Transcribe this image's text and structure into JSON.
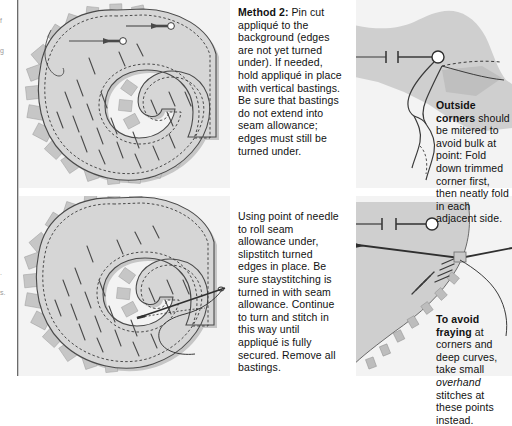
{
  "page": {
    "background_color": "#ffffff",
    "panel_color": "#f3f3f3",
    "fabric_color": "#d4d4d4",
    "fabric_shadow_color": "#bdbdbd",
    "ink_color": "#3a3a3a",
    "text_color": "#111111"
  },
  "margin_fragments": [
    {
      "name": "left-edge-fragment-1",
      "text": "f"
    },
    {
      "name": "left-edge-fragment-2",
      "text": "g"
    },
    {
      "name": "left-edge-fragment-3",
      "text": "."
    },
    {
      "name": "left-edge-fragment-4",
      "text": "s."
    }
  ],
  "text_blocks": {
    "method2": {
      "heading": "Method 2:",
      "body": " Pin cut appliqué to the background (edges are not yet turned under). If needed, hold appliqué in place with vertical bastings. Be sure that bastings do not extend into seam allowance; edges must still be turned under."
    },
    "slipstitch": {
      "heading": "",
      "body": "Using point of needle to roll seam allowance under, slipstitch turned edges in place. Be sure staystitching is turned in with seam allowance. Continue to turn and stitch in this way until appliqué is fully secured. Remove all bastings."
    },
    "outside_corners": {
      "heading": "Outside corners",
      "body": " should be mitered to avoid bulk at point: Fold down trimmed corner first, then neatly fold in each adjacent side."
    },
    "avoid_fraying": {
      "heading": "To avoid fraying",
      "body_pre": " at corners and deep curves, take small ",
      "body_em": "overhand",
      "body_post": " stitches at these points instead."
    }
  },
  "figures": {
    "top_left": {
      "name": "figure-pinned-applique",
      "caption_ref": "method2",
      "elements": [
        "g-shaped-applique",
        "seam-allowance-notches",
        "staystitching-dashed-line",
        "basting-stitches",
        "straight-pins",
        "loose-thread-tail"
      ],
      "pin_count": 2
    },
    "bottom_left": {
      "name": "figure-slipstitching-applique",
      "caption_ref": "slipstitch",
      "elements": [
        "g-shaped-applique",
        "seam-allowance-notches",
        "staystitching-dashed-line",
        "basting-stitches",
        "needle",
        "thread"
      ],
      "needle_count": 1
    },
    "top_right": {
      "name": "figure-outside-corner-detail",
      "caption_ref": "outside_corners",
      "elements": [
        "mitered-corner",
        "folded-flap",
        "straight-pin",
        "fold-lines"
      ]
    },
    "bottom_right": {
      "name": "figure-overhand-stitch-detail",
      "caption_ref": "avoid_fraying",
      "elements": [
        "curved-fabric-edge",
        "overhand-stitches",
        "needle",
        "thread",
        "straight-pin"
      ]
    }
  }
}
